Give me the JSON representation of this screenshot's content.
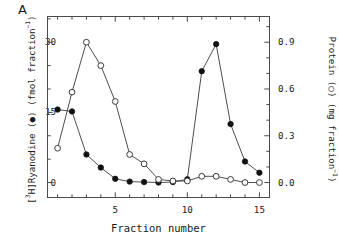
{
  "panel": {
    "letter": "A"
  },
  "axes": {
    "xlabel": "Fraction number",
    "ylabel_left_parts": {
      "prefix": "[",
      "sup1": "3",
      "mid": "H]Ryanodine (●) (fmol fraction",
      "sup2": "−1",
      "suffix": ")"
    },
    "ylabel_left": "[3H]Ryanodine (●) (fmol fraction−1)",
    "ylabel_right_parts": {
      "mid": "Protein (○) (mg fraction",
      "sup": "−1",
      "suffix": ")"
    },
    "ylabel_right": "Protein (○) (mg fraction−1)",
    "x_ticks": [
      "5",
      "10",
      "15"
    ],
    "y_ticks_left": [
      "0",
      "15",
      "30"
    ],
    "y_ticks_right": [
      "0.0",
      "0.3",
      "0.6",
      "0.9"
    ]
  },
  "chart_data": {
    "type": "line",
    "title": "",
    "xlabel": "Fraction number",
    "ylabel": "[3H]Ryanodine (fmol fraction-1)",
    "ylabel_secondary": "Protein (mg fraction-1)",
    "x": [
      1,
      2,
      3,
      4,
      5,
      6,
      7,
      8,
      9,
      10,
      11,
      12,
      13,
      14,
      15
    ],
    "xlim": [
      0.3,
      15.7
    ],
    "ylim": [
      -3.2,
      35.5
    ],
    "ylim_secondary": [
      -0.096,
      1.065
    ],
    "grid": false,
    "legend": "none",
    "series": [
      {
        "name": "[3H]Ryanodine",
        "marker": "filled-circle",
        "axis": "left",
        "color": "#000000",
        "values": [
          15.6,
          15.2,
          6.0,
          3.2,
          0.8,
          0.2,
          0.1,
          0.0,
          0.1,
          0.7,
          23.8,
          29.6,
          12.5,
          4.5,
          2.1
        ]
      },
      {
        "name": "Protein",
        "marker": "open-circle",
        "axis": "right",
        "color": "#000000",
        "values": [
          0.22,
          0.58,
          0.9,
          0.75,
          0.52,
          0.18,
          0.12,
          0.02,
          0.01,
          0.01,
          0.04,
          0.04,
          0.02,
          0.0,
          0.0
        ]
      }
    ]
  },
  "style": {
    "axis_color": "#4a4a4a",
    "line_color": "#3a3a3a",
    "marker_fill": "#111111",
    "background": "#ffffff"
  }
}
